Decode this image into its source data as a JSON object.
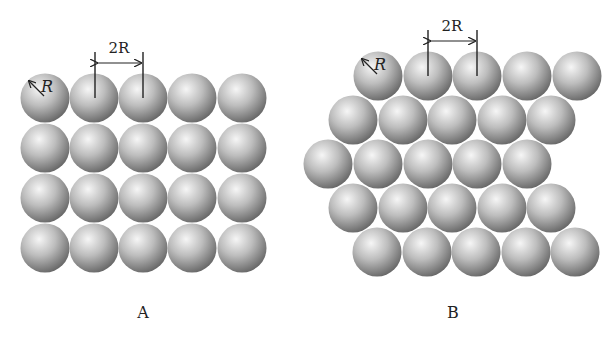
{
  "figure": {
    "panels": [
      {
        "id": "A",
        "caption": "A",
        "arrangement": "square",
        "rows": 4,
        "cols": 5,
        "radius_label": "R",
        "spacing_label": "2R",
        "circles": [
          [
            45,
            98
          ],
          [
            94,
            98
          ],
          [
            143,
            98
          ],
          [
            192,
            98
          ],
          [
            242,
            98
          ],
          [
            45,
            148
          ],
          [
            94,
            148
          ],
          [
            143,
            148
          ],
          [
            192,
            148
          ],
          [
            242,
            148
          ],
          [
            45,
            198
          ],
          [
            94,
            198
          ],
          [
            143,
            198
          ],
          [
            192,
            198
          ],
          [
            242,
            198
          ],
          [
            45,
            248
          ],
          [
            94,
            248
          ],
          [
            143,
            248
          ],
          [
            192,
            248
          ],
          [
            242,
            248
          ]
        ]
      },
      {
        "id": "B",
        "caption": "B",
        "arrangement": "hexagonal",
        "rows": 5,
        "cols": 5,
        "radius_label": "R",
        "spacing_label": "2R",
        "circles": [
          [
            378,
            76
          ],
          [
            428,
            76
          ],
          [
            477,
            76
          ],
          [
            527,
            76
          ],
          [
            577,
            76
          ],
          [
            353,
            120
          ],
          [
            403,
            120
          ],
          [
            452,
            120
          ],
          [
            502,
            120
          ],
          [
            551,
            120
          ],
          [
            328,
            164
          ],
          [
            378,
            164
          ],
          [
            428,
            164
          ],
          [
            477,
            164
          ],
          [
            527,
            164
          ],
          [
            353,
            208
          ],
          [
            403,
            208
          ],
          [
            452,
            208
          ],
          [
            502,
            208
          ],
          [
            551,
            208
          ],
          [
            377,
            252
          ],
          [
            427,
            252
          ],
          [
            476,
            252
          ],
          [
            526,
            252
          ],
          [
            575,
            252
          ]
        ]
      }
    ],
    "sphere_radius_px": 24.5,
    "colors": {
      "sphere_light": "#f4f4f4",
      "sphere_mid": "#b8b8b8",
      "sphere_dark": "#5a5a5a",
      "ink": "#222222"
    }
  }
}
